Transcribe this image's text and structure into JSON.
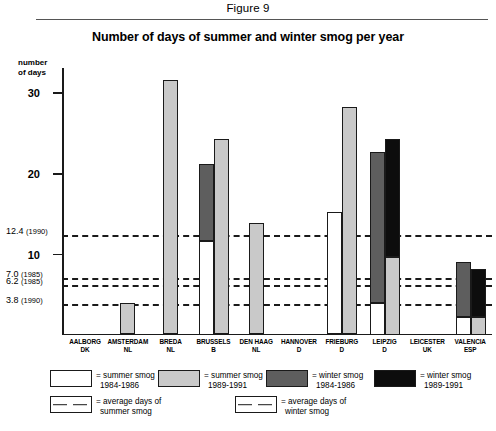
{
  "figure_label": "Figure 9",
  "title": "Number of days of summer and winter smog per year",
  "axis_caption_line1": "number",
  "axis_caption_line2": "of days",
  "legend": {
    "row1": [
      {
        "swatch": "white",
        "line1": "= summer smog",
        "line2": "1984-1986"
      },
      {
        "swatch": "light",
        "line1": "= summer smog",
        "line2": "1989-1991"
      },
      {
        "swatch": "dark",
        "line1": "= winter smog",
        "line2": "1984-1986"
      },
      {
        "swatch": "black",
        "line1": "= winter smog",
        "line2": "1989-1991"
      }
    ],
    "row2": [
      {
        "swatch": "dashed",
        "line1": "= average days of",
        "line2": "summer smog"
      },
      {
        "swatch": "dashed",
        "line1": "= average days of",
        "line2": "winter smog"
      }
    ]
  },
  "chart_data": {
    "type": "bar",
    "title": "Number of days of summer and winter smog per year",
    "xlabel": "",
    "ylabel": "number of days",
    "ylim": [
      0,
      33
    ],
    "yticks": [
      10,
      20,
      30
    ],
    "grid": false,
    "legend_position": "below",
    "categories": [
      {
        "city": "AALBORG",
        "country": "DK"
      },
      {
        "city": "AMSTERDAM",
        "country": "NL"
      },
      {
        "city": "BREDA",
        "country": "NL"
      },
      {
        "city": "BRUSSELS",
        "country": "B"
      },
      {
        "city": "DEN HAAG",
        "country": "NL"
      },
      {
        "city": "HANNOVER",
        "country": "D"
      },
      {
        "city": "FRIEBURG",
        "country": "D"
      },
      {
        "city": "LEIPZIG",
        "country": "D"
      },
      {
        "city": "LEICESTER",
        "country": "UK"
      },
      {
        "city": "VALENCIA",
        "country": "ESP"
      }
    ],
    "series": [
      {
        "name": "summer smog 1984-1986",
        "color": "#ffffff",
        "values": [
          0,
          0,
          0,
          11.5,
          0,
          0,
          15.0,
          3.8,
          0,
          2.0
        ]
      },
      {
        "name": "summer smog 1989-1991",
        "color": "#c9c9c9",
        "values": [
          0,
          3.8,
          31.3,
          24.0,
          13.7,
          0,
          28.0,
          9.5,
          0,
          2.0
        ]
      },
      {
        "name": "winter smog 1984-1986",
        "color": "#5e5e5e",
        "values": [
          0,
          0,
          0,
          21.0,
          0,
          0,
          0,
          22.5,
          0,
          8.8
        ]
      },
      {
        "name": "winter smog 1989-1991",
        "color": "#0d0d0d",
        "values": [
          0,
          0,
          0,
          0,
          0,
          0,
          0,
          24.0,
          0,
          8.0
        ]
      }
    ],
    "average_lines": [
      {
        "value": 12.4,
        "year": "1990",
        "label": "12.4",
        "year_label": "(1990)"
      },
      {
        "value": 7.0,
        "year": "1985",
        "label": "7.0",
        "year_label": "(1985)"
      },
      {
        "value": 6.2,
        "year": "1985",
        "label": "6.2",
        "year_label": "(1985)"
      },
      {
        "value": 3.8,
        "year": "1990",
        "label": "3.8",
        "year_label": "(1990)"
      }
    ]
  }
}
